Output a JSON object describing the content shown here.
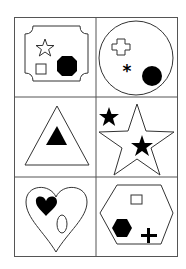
{
  "title": "",
  "grid": {
    "rows": 3,
    "cols": 2,
    "line_color": "#555555"
  },
  "cells": [
    {
      "position": "row1-col1",
      "container": "notched-square",
      "contents": [
        "outline-star",
        "outline-square",
        "filled-octagon"
      ]
    },
    {
      "position": "row1-col2",
      "container": "circle",
      "contents": [
        "outline-cross",
        "filled-asterisk",
        "filled-circle"
      ]
    },
    {
      "position": "row2-col1",
      "container": "triangle",
      "contents": [
        "filled-triangle"
      ]
    },
    {
      "position": "row2-col2",
      "container": "star",
      "contents": [
        "filled-star",
        "filled-star"
      ]
    },
    {
      "position": "row3-col1",
      "container": "heart",
      "contents": [
        "filled-heart",
        "outline-ellipse"
      ]
    },
    {
      "position": "row3-col2",
      "container": "hexagon",
      "contents": [
        "outline-square",
        "filled-hexagon",
        "filled-plus"
      ]
    }
  ]
}
